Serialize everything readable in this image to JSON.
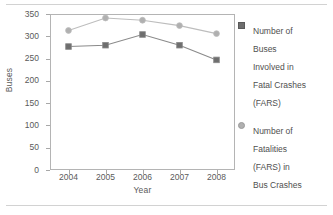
{
  "chart_data": {
    "type": "line",
    "title": "",
    "xlabel": "Year",
    "ylabel": "Buses",
    "categories": [
      "2004",
      "2005",
      "2006",
      "2007",
      "2008"
    ],
    "x": [
      2004,
      2005,
      2006,
      2007,
      2008
    ],
    "ylim": [
      0,
      350
    ],
    "yticks": [
      0,
      50,
      100,
      150,
      200,
      250,
      300,
      350
    ],
    "ytick_labels": [
      "0",
      "50",
      "100",
      "150",
      "200",
      "250",
      "300",
      "350"
    ],
    "grid": false,
    "legend_position": "right",
    "series": [
      {
        "name": "Number of Buses Involved in Fatal Crashes (FARS)",
        "legend_label": "Number of\nBuses\nInvolved in\nFatal Crashes\n(FARS)",
        "marker": "square",
        "color": "#6e6e6e",
        "line_color": "#8a8a8a",
        "values": [
          277,
          280,
          304,
          280,
          247
        ]
      },
      {
        "name": "Number of Fatalities (FARS) in Bus Crashes",
        "legend_label": "Number of\nFatalities\n(FARS) in\nBus Crashes",
        "marker": "circle",
        "color": "#b0b0b0",
        "line_color": "#bdbdbd",
        "values": [
          313,
          341,
          336,
          324,
          306
        ]
      }
    ]
  },
  "axes": {
    "y_title": "Buses",
    "x_title": "Year"
  },
  "colors": {
    "frame": "#b4b4b4",
    "text": "#5a5a5a",
    "rule": "#d2d2d2",
    "series1": "#6e6e6e",
    "series2": "#b0b0b0"
  }
}
